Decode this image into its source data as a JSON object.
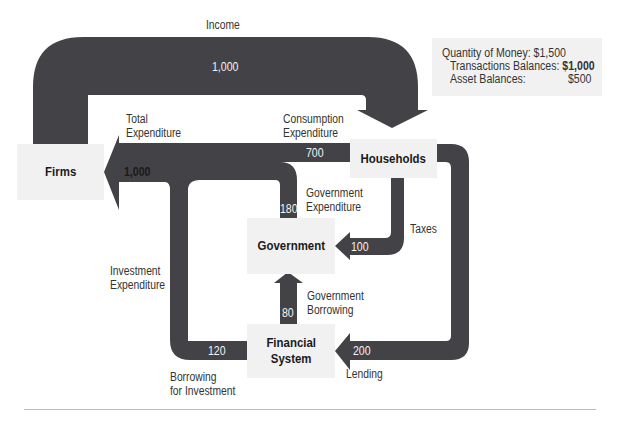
{
  "colors": {
    "flow": "#434246",
    "box": "#f1f1f1",
    "text": "#333333"
  },
  "nodes": {
    "firms": "Firms",
    "households": "Households",
    "government": "Government",
    "financial_system": "Financial\nSystem"
  },
  "flows": {
    "income": {
      "label": "Income",
      "value": "1,000"
    },
    "total_expenditure": {
      "label": "Total\nExpenditure",
      "value": "1,000"
    },
    "consumption_expenditure": {
      "label": "Consumption\nExpenditure",
      "value": "700"
    },
    "government_expenditure": {
      "label": "Government\nExpenditure",
      "value": "180"
    },
    "taxes": {
      "label": "Taxes",
      "value": "100"
    },
    "government_borrowing": {
      "label": "Government\nBorrowing",
      "value": "80"
    },
    "investment_expenditure": {
      "label": "Investment\nExpenditure"
    },
    "borrowing_for_investment": {
      "label": "Borrowing\nfor Investment",
      "value": "120"
    },
    "lending": {
      "label": "Lending",
      "value": "200"
    }
  },
  "money_info": {
    "quantity_label": "Quantity of Money:",
    "quantity_value": "$1,500",
    "transactions_label": "Transactions Balances:",
    "transactions_value": "$1,000",
    "asset_label": "Asset Balances:",
    "asset_value": "$500"
  }
}
